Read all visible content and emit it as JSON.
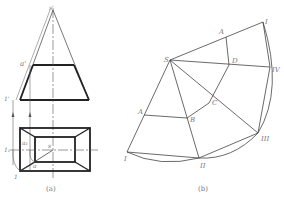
{
  "figure": {
    "panel_a": {
      "caption": "(a)",
      "labels": {
        "apex_front": "s'",
        "point_a_front": "a'",
        "point_1_front": "1'",
        "point_a_top": "a",
        "apex_top": "s",
        "point_1_top": "1",
        "true_length_label": "1₁",
        "a1_label": "a₁"
      }
    },
    "panel_b": {
      "caption": "(b)",
      "labels": {
        "S": "S",
        "A_top": "A",
        "D": "D",
        "C": "C",
        "B": "B",
        "A_left": "A",
        "I_top": "I",
        "IV": "IV",
        "III": "III",
        "II": "II",
        "I_bottom": "I"
      }
    },
    "colors": {
      "line": "#333333",
      "thin": "#555555",
      "label": "#777777"
    }
  }
}
